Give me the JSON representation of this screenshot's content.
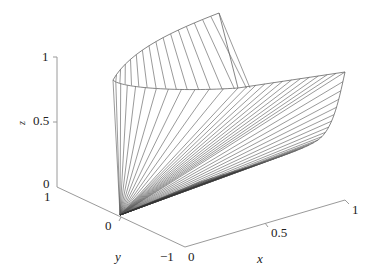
{
  "chart_data": {
    "type": "surface3d",
    "title": "",
    "style": "wireframe mesh of rays from origin",
    "xlabel": "x",
    "ylabel": "y",
    "zlabel": "z",
    "xlim": [
      0,
      1
    ],
    "ylim": [
      -1,
      1
    ],
    "zlim": [
      0,
      1
    ],
    "x_ticks": [
      "0",
      "0.5",
      "1"
    ],
    "y_ticks": [
      "1",
      "0",
      "-1"
    ],
    "z_ticks": [
      "0",
      "0.5",
      "1"
    ],
    "grid": false,
    "legend": null,
    "line_color": "#555555",
    "axis_color": "#999999"
  },
  "labels": {
    "z_tick_1": "1",
    "z_tick_05": "0.5",
    "z_tick_0": "0",
    "y_tick_1": "1",
    "y_tick_0": "0",
    "y_tick_m1": "−1",
    "x_tick_0": "0",
    "x_tick_05": "0.5",
    "x_tick_1": "1",
    "x_title": "x",
    "y_title": "y",
    "z_title": "z"
  }
}
